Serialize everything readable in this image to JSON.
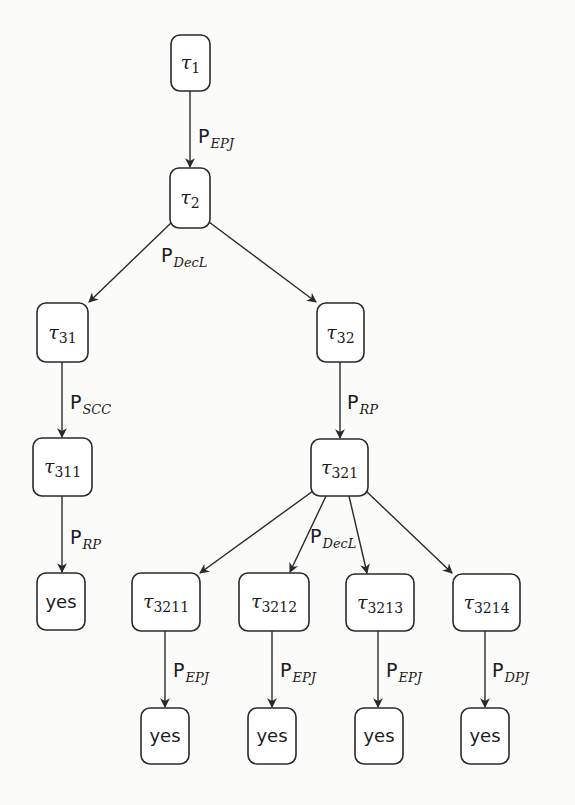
{
  "diagram": {
    "type": "derivation-tree",
    "nodes": [
      {
        "id": "t1",
        "kind": "tau",
        "symbol": "τ",
        "sub": "1"
      },
      {
        "id": "t2",
        "kind": "tau",
        "symbol": "τ",
        "sub": "2"
      },
      {
        "id": "t31",
        "kind": "tau",
        "symbol": "τ",
        "sub": "31"
      },
      {
        "id": "t32",
        "kind": "tau",
        "symbol": "τ",
        "sub": "32"
      },
      {
        "id": "t311",
        "kind": "tau",
        "symbol": "τ",
        "sub": "311"
      },
      {
        "id": "t321",
        "kind": "tau",
        "symbol": "τ",
        "sub": "321"
      },
      {
        "id": "y311",
        "kind": "yes",
        "text": "yes"
      },
      {
        "id": "t3211",
        "kind": "tau",
        "symbol": "τ",
        "sub": "3211"
      },
      {
        "id": "t3212",
        "kind": "tau",
        "symbol": "τ",
        "sub": "3212"
      },
      {
        "id": "t3213",
        "kind": "tau",
        "symbol": "τ",
        "sub": "3213"
      },
      {
        "id": "t3214",
        "kind": "tau",
        "symbol": "τ",
        "sub": "3214"
      },
      {
        "id": "y3211",
        "kind": "yes",
        "text": "yes"
      },
      {
        "id": "y3212",
        "kind": "yes",
        "text": "yes"
      },
      {
        "id": "y3213",
        "kind": "yes",
        "text": "yes"
      },
      {
        "id": "y3214",
        "kind": "yes",
        "text": "yes"
      }
    ],
    "edges": [
      {
        "from": "t1",
        "to": "t2"
      },
      {
        "from": "t2",
        "to": "t31"
      },
      {
        "from": "t2",
        "to": "t32"
      },
      {
        "from": "t31",
        "to": "t311"
      },
      {
        "from": "t32",
        "to": "t321"
      },
      {
        "from": "t311",
        "to": "y311"
      },
      {
        "from": "t321",
        "to": "t3211"
      },
      {
        "from": "t321",
        "to": "t3212"
      },
      {
        "from": "t321",
        "to": "t3213"
      },
      {
        "from": "t321",
        "to": "t3214"
      },
      {
        "from": "t3211",
        "to": "y3211"
      },
      {
        "from": "t3212",
        "to": "y3212"
      },
      {
        "from": "t3213",
        "to": "y3213"
      },
      {
        "from": "t3214",
        "to": "y3214"
      }
    ],
    "edge_labels": [
      {
        "id": "lbl-t1-t2",
        "main": "P",
        "sub": "EPJ"
      },
      {
        "id": "lbl-t2-split",
        "main": "P",
        "sub": "DecL"
      },
      {
        "id": "lbl-t31-t311",
        "main": "P",
        "sub": "SCC"
      },
      {
        "id": "lbl-t32-t321",
        "main": "P",
        "sub": "RP"
      },
      {
        "id": "lbl-t311-yes",
        "main": "P",
        "sub": "RP"
      },
      {
        "id": "lbl-t321-split",
        "main": "P",
        "sub": "DecL"
      },
      {
        "id": "lbl-t3211-yes",
        "main": "P",
        "sub": "EPJ"
      },
      {
        "id": "lbl-t3212-yes",
        "main": "P",
        "sub": "EPJ"
      },
      {
        "id": "lbl-t3213-yes",
        "main": "P",
        "sub": "EPJ"
      },
      {
        "id": "lbl-t3214-yes",
        "main": "P",
        "sub": "DPJ"
      }
    ]
  }
}
